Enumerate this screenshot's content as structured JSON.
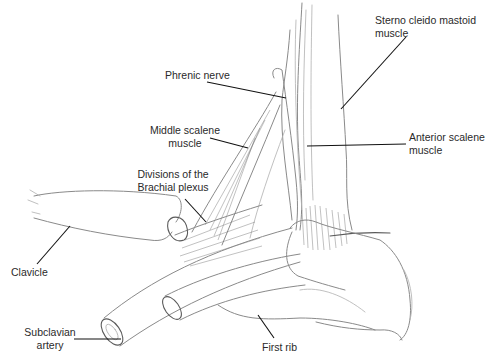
{
  "figure": {
    "labels": {
      "sterno": {
        "line1": "Sterno cleido mastoid",
        "line2": "muscle"
      },
      "phrenic": {
        "line1": "Phrenic nerve"
      },
      "middle_scalene": {
        "line1": "Middle scalene",
        "line2": "muscle"
      },
      "anterior_scalene": {
        "line1": "Anterior scalene",
        "line2": "muscle"
      },
      "brachial": {
        "line1": "Divisions of the",
        "line2": "Brachial plexus"
      },
      "clavicle": {
        "line1": "Clavicle"
      },
      "subclavian": {
        "line1": "Subclavian",
        "line2": "artery"
      },
      "first_rib": {
        "line1": "First rib"
      }
    }
  }
}
